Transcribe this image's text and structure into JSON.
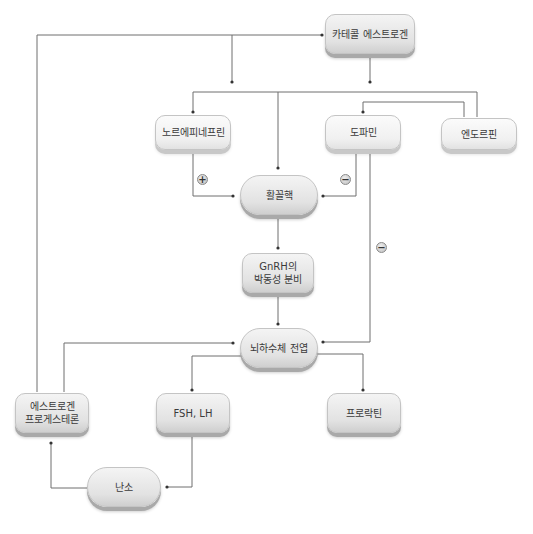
{
  "diagram": {
    "nodes": {
      "catechol_estrogen": "카테콜 에스트로겐",
      "norepinephrine": "노르에피네프린",
      "dopamine": "도파민",
      "endorphin": "엔도르핀",
      "arcuate_nucleus": "활꼴핵",
      "gnrh_pulsatile": "GnRH의\n박동성 분비",
      "anterior_pituitary": "뇌하수체 전엽",
      "estrogen_progesterone": "에스트로겐\n프로게스테론",
      "fsh_lh": "FSH, LH",
      "prolactin": "프로락틴",
      "ovary": "난소"
    },
    "signs": {
      "norepinephrine_effect": "+",
      "dopamine_effect_arcuate": "−",
      "dopamine_effect_pituitary": "−"
    },
    "colors": {
      "line": "#6e6e6e",
      "box_fill": "#e2e2e2",
      "box_shadow": "#a9a9a9"
    }
  }
}
